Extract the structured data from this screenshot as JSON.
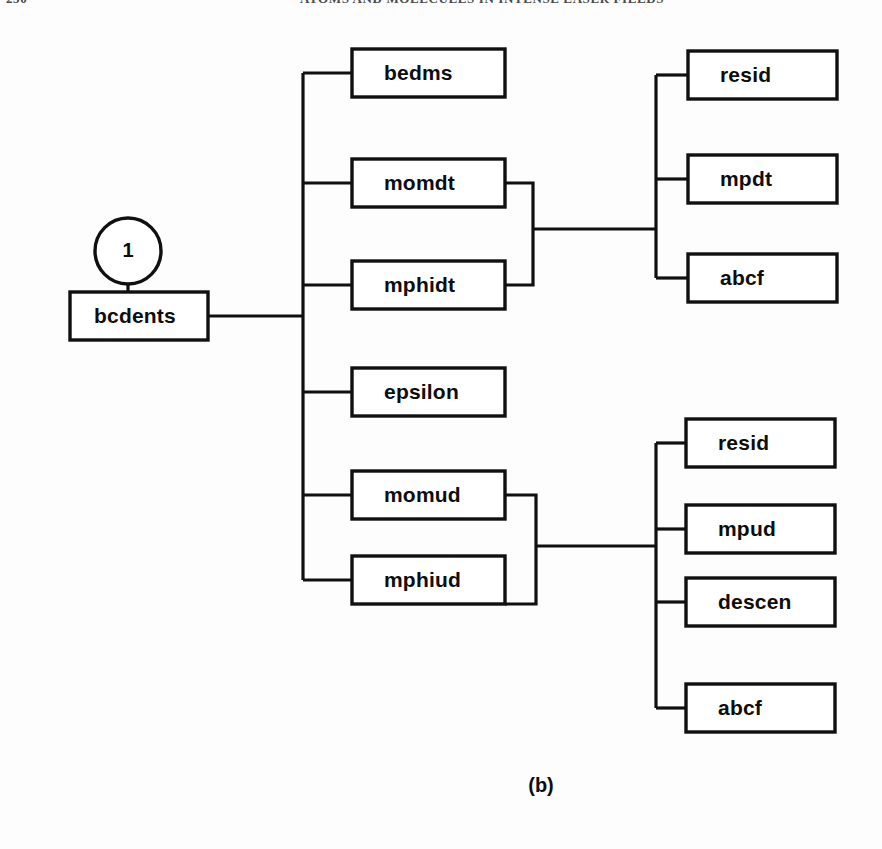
{
  "page": {
    "running_head_left": "250",
    "running_head_right": "ATOMS AND MOLECULES IN INTENSE LASER FIELDS",
    "caption": "(b)",
    "background_color": "#fdfdfd",
    "line_color": "#101010"
  },
  "diagram": {
    "type": "tree",
    "root": {
      "label": "bcdents",
      "x": 70,
      "y": 292,
      "w": 138,
      "h": 48
    },
    "marker": {
      "label": "1",
      "cx": 128,
      "cy": 251,
      "r": 33
    },
    "spines": {
      "level1_x": 303,
      "level1_top": 73,
      "level1_bottom": 580,
      "root_join_y": 316,
      "group_top_x": 656,
      "group_top_top": 75,
      "group_top_bottom": 278,
      "group_top_join_y": 229,
      "group_bot_x": 656,
      "group_bot_top": 443,
      "group_bot_bottom": 708,
      "group_bot_join_y": 546,
      "bracket_top_x": 533,
      "bracket_bot_x": 536
    },
    "level1": [
      {
        "label": "bedms",
        "x": 352,
        "y": 49,
        "w": 153,
        "h": 48,
        "cy": 73
      },
      {
        "label": "momdt",
        "x": 352,
        "y": 159,
        "w": 153,
        "h": 48,
        "cy": 183
      },
      {
        "label": "mphidt",
        "x": 352,
        "y": 261,
        "w": 153,
        "h": 48,
        "cy": 285
      },
      {
        "label": "epsilon",
        "x": 352,
        "y": 368,
        "w": 153,
        "h": 48,
        "cy": 392
      },
      {
        "label": "momud",
        "x": 352,
        "y": 471,
        "w": 153,
        "h": 48,
        "cy": 495
      },
      {
        "label": "mphiud",
        "x": 352,
        "y": 556,
        "w": 153,
        "h": 48,
        "cy": 580
      }
    ],
    "group_top": [
      {
        "label": "resid",
        "x": 688,
        "y": 51,
        "w": 149,
        "h": 48,
        "cy": 75
      },
      {
        "label": "mpdt",
        "x": 688,
        "y": 155,
        "w": 149,
        "h": 48,
        "cy": 179
      },
      {
        "label": "abcf",
        "x": 688,
        "y": 254,
        "w": 149,
        "h": 48,
        "cy": 278
      }
    ],
    "group_bottom": [
      {
        "label": "resid",
        "x": 686,
        "y": 419,
        "w": 149,
        "h": 48,
        "cy": 443
      },
      {
        "label": "mpud",
        "x": 686,
        "y": 505,
        "w": 149,
        "h": 48,
        "cy": 529
      },
      {
        "label": "descen",
        "x": 686,
        "y": 578,
        "w": 149,
        "h": 48,
        "cy": 602
      },
      {
        "label": "abcf",
        "x": 686,
        "y": 684,
        "w": 149,
        "h": 48,
        "cy": 708
      }
    ],
    "label_offset_x": 32,
    "caption_pos": {
      "x": 541,
      "y": 792
    }
  }
}
